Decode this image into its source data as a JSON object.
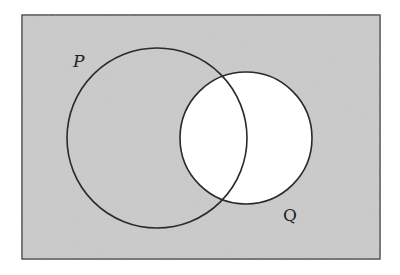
{
  "diagram": {
    "type": "venn",
    "shaded_region": "complement of Q",
    "colors": {
      "shade": "#c9c9c9",
      "stroke": "#333333",
      "unshaded": "#ffffff"
    },
    "sets": [
      {
        "label": "P",
        "cx": 157,
        "cy": 138,
        "r": 90
      },
      {
        "label": "Q",
        "cx": 246,
        "cy": 138,
        "r": 66
      }
    ]
  }
}
